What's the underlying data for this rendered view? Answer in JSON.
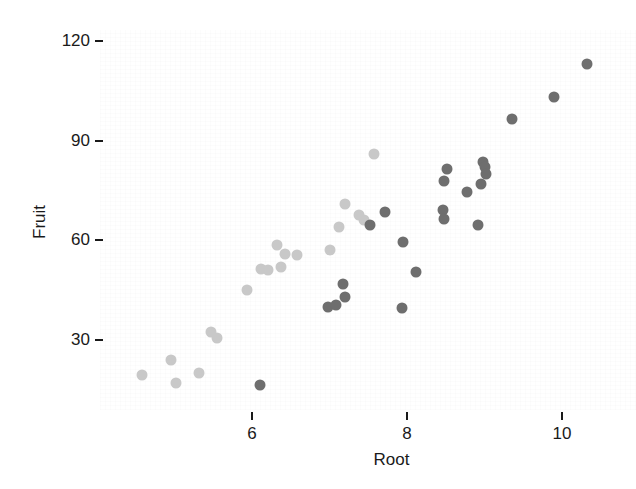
{
  "chart_data": {
    "type": "scatter",
    "title": "",
    "xlabel": "Root",
    "ylabel": "Fruit",
    "xlim": [
      4.2,
      10.7
    ],
    "ylim": [
      13,
      126
    ],
    "xticks": [
      6,
      8,
      10
    ],
    "yticks": [
      30,
      60,
      90,
      120
    ],
    "xtick_labels": [
      "6",
      "8",
      "10"
    ],
    "ytick_labels": [
      "30",
      "60",
      "90",
      "120"
    ],
    "grid": false,
    "legend": null,
    "marker": "filled-circle",
    "marker_size_px": 11,
    "colors": {
      "light": "#c8c8c8",
      "medium": "#a8a8a8",
      "dark": "#6e6e6e",
      "axis_text": "#1a1a1a",
      "background": "#ffffff"
    },
    "points": [
      {
        "x": 4.58,
        "y": 19.5,
        "shade": "light"
      },
      {
        "x": 5.02,
        "y": 17.0,
        "shade": "light"
      },
      {
        "x": 4.95,
        "y": 24.0,
        "shade": "light"
      },
      {
        "x": 5.32,
        "y": 20.0,
        "shade": "light"
      },
      {
        "x": 5.47,
        "y": 32.5,
        "shade": "light"
      },
      {
        "x": 5.55,
        "y": 30.5,
        "shade": "light"
      },
      {
        "x": 6.1,
        "y": 16.5,
        "shade": "dark"
      },
      {
        "x": 5.94,
        "y": 45.0,
        "shade": "light"
      },
      {
        "x": 6.12,
        "y": 51.5,
        "shade": "light"
      },
      {
        "x": 6.2,
        "y": 51.0,
        "shade": "light"
      },
      {
        "x": 6.37,
        "y": 52.0,
        "shade": "light"
      },
      {
        "x": 6.32,
        "y": 58.5,
        "shade": "light"
      },
      {
        "x": 6.42,
        "y": 56.0,
        "shade": "light"
      },
      {
        "x": 6.58,
        "y": 55.5,
        "shade": "light"
      },
      {
        "x": 7.0,
        "y": 57.0,
        "shade": "light"
      },
      {
        "x": 6.98,
        "y": 40.0,
        "shade": "dark"
      },
      {
        "x": 7.08,
        "y": 40.5,
        "shade": "dark"
      },
      {
        "x": 7.12,
        "y": 64.0,
        "shade": "light"
      },
      {
        "x": 7.2,
        "y": 71.0,
        "shade": "light"
      },
      {
        "x": 7.17,
        "y": 47.0,
        "shade": "dark"
      },
      {
        "x": 7.2,
        "y": 43.0,
        "shade": "dark"
      },
      {
        "x": 7.38,
        "y": 67.5,
        "shade": "light"
      },
      {
        "x": 7.45,
        "y": 66.0,
        "shade": "light"
      },
      {
        "x": 7.57,
        "y": 86.0,
        "shade": "light"
      },
      {
        "x": 7.52,
        "y": 64.5,
        "shade": "dark"
      },
      {
        "x": 7.72,
        "y": 68.5,
        "shade": "dark"
      },
      {
        "x": 7.93,
        "y": 39.5,
        "shade": "dark"
      },
      {
        "x": 7.95,
        "y": 59.5,
        "shade": "dark"
      },
      {
        "x": 8.12,
        "y": 50.5,
        "shade": "dark"
      },
      {
        "x": 8.48,
        "y": 78.0,
        "shade": "dark"
      },
      {
        "x": 8.46,
        "y": 69.0,
        "shade": "dark"
      },
      {
        "x": 8.48,
        "y": 66.5,
        "shade": "dark"
      },
      {
        "x": 8.52,
        "y": 81.5,
        "shade": "dark"
      },
      {
        "x": 8.78,
        "y": 74.5,
        "shade": "dark"
      },
      {
        "x": 8.98,
        "y": 83.5,
        "shade": "dark"
      },
      {
        "x": 9.0,
        "y": 82.0,
        "shade": "dark"
      },
      {
        "x": 9.02,
        "y": 80.0,
        "shade": "dark"
      },
      {
        "x": 8.96,
        "y": 77.0,
        "shade": "dark"
      },
      {
        "x": 8.92,
        "y": 64.5,
        "shade": "dark"
      },
      {
        "x": 9.36,
        "y": 96.5,
        "shade": "dark"
      },
      {
        "x": 9.9,
        "y": 103.0,
        "shade": "dark"
      },
      {
        "x": 10.32,
        "y": 113.0,
        "shade": "dark"
      }
    ]
  },
  "axes": {
    "y_title": "Fruit",
    "x_title": "Root"
  }
}
